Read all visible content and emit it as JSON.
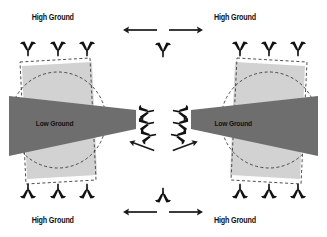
{
  "diagram": {
    "background_color": "#ffffff",
    "width": 327,
    "height": 237,
    "palette": {
      "high_ground_fill": "#d2d2d2",
      "low_ground_fill": "#6e6e6e",
      "dashed_outline": "#3a3a3a",
      "unit_marker": "#111111",
      "arrow": "#1a1a1a",
      "label_text": "#111111"
    },
    "labels": {
      "high_ground_top_left": "High Ground",
      "high_ground_top_right": "High Ground",
      "high_ground_bottom_left": "High Ground",
      "high_ground_bottom_right": "High Ground",
      "low_ground_left": "Low Ground",
      "low_ground_right": "Low Ground"
    },
    "terrain_regions": [
      {
        "name": "left-terrain-block",
        "side": "left",
        "high_ground_label": "High Ground",
        "low_ground_label": "Low Ground",
        "low_ground_taper": "narrows-toward-center"
      },
      {
        "name": "right-terrain-block",
        "side": "right",
        "high_ground_label": "High Ground",
        "low_ground_label": "Low Ground",
        "low_ground_taper": "narrows-toward-center"
      }
    ],
    "unit_markers": {
      "top_left_count": 3,
      "top_right_count": 3,
      "bottom_left_count": 3,
      "bottom_right_count": 3,
      "top_center_count": 1,
      "bottom_center_count": 1,
      "center_left_cluster_count": 3,
      "center_right_cluster_count": 3,
      "top_orientation": "pointing-down",
      "bottom_orientation": "pointing-up",
      "center_left_orientation": "pointing-right",
      "center_right_orientation": "pointing-left"
    },
    "movement_arrows": {
      "top_left_arrow": "points-left",
      "top_right_arrow": "points-right",
      "bottom_left_arrow": "points-left",
      "bottom_right_arrow": "points-right",
      "center_left_diagonal": "points-down-left",
      "center_right_diagonal": "points-down-right"
    }
  }
}
